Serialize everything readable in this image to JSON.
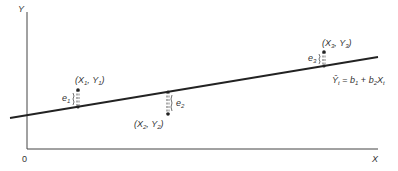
{
  "diagram": {
    "axes": {
      "y_label": "Y",
      "x_label": "X",
      "origin_label": "0"
    },
    "regression_line": {
      "equation": {
        "lhs": "Ŷ",
        "lhs_sub": "t",
        "eq": "=",
        "b1": "b",
        "b1_sub": "1",
        "plus": "+",
        "b2": "b",
        "b2_sub": "2",
        "x": "X",
        "x_sub": "t"
      }
    },
    "points": [
      {
        "label_x": "X",
        "label_x_sub": "1",
        "label_y": "Y",
        "label_y_sub": "1",
        "residual": "e",
        "residual_sub": "1"
      },
      {
        "label_x": "X",
        "label_x_sub": "2",
        "label_y": "Y",
        "label_y_sub": "2",
        "residual": "e",
        "residual_sub": "2"
      },
      {
        "label_x": "X",
        "label_x_sub": "3",
        "label_y": "Y",
        "label_y_sub": "3",
        "residual": "e",
        "residual_sub": "3"
      }
    ],
    "colors": {
      "line": "#222222",
      "text": "#333333",
      "background": "#ffffff"
    }
  }
}
